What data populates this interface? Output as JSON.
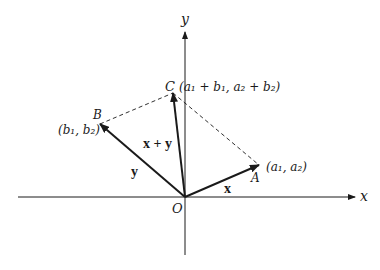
{
  "axes": {
    "x_label": "x",
    "y_label": "y",
    "origin_label": "O"
  },
  "points": {
    "A": {
      "name": "A",
      "coords": "(a₁, a₂)"
    },
    "B": {
      "name": "B",
      "coords": "(b₁, b₂)"
    },
    "C": {
      "name": "C",
      "coords": "(a₁ + b₁, a₂ + b₂)"
    }
  },
  "vectors": {
    "x": "x",
    "y": "y",
    "sum": "x + y"
  },
  "colors": {
    "ink": "#1a1a1a",
    "background": "#ffffff"
  }
}
